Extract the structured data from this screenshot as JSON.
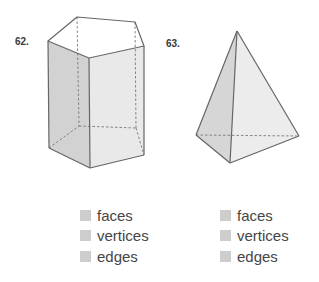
{
  "problems": [
    {
      "number": "62.",
      "figure": "pentagonal-prism",
      "answers": [
        {
          "label": "faces",
          "value": ""
        },
        {
          "label": "vertices",
          "value": ""
        },
        {
          "label": "edges",
          "value": ""
        }
      ]
    },
    {
      "number": "63.",
      "figure": "triangular-pyramid",
      "answers": [
        {
          "label": "faces",
          "value": ""
        },
        {
          "label": "vertices",
          "value": ""
        },
        {
          "label": "edges",
          "value": ""
        }
      ]
    }
  ],
  "colors": {
    "edge": "#6a6a6a",
    "face_shade": "#d4d4d4",
    "face_light": "#ececec",
    "answer_box": "#cdcdcd"
  }
}
